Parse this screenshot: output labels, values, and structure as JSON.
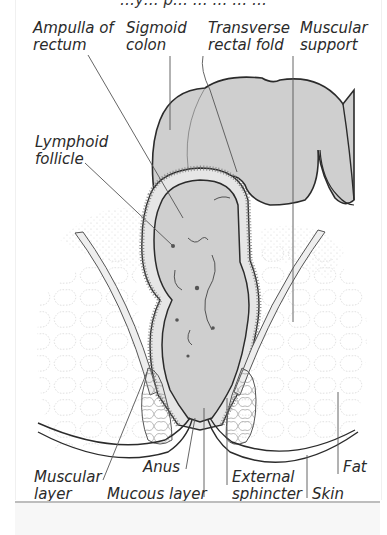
{
  "figure": {
    "title_partial": "…y… p… … … … …",
    "colors": {
      "tissue_fill": "#cfcfcf",
      "outline": "#2b2b2b",
      "leader_line": "#555555",
      "text": "#2a2a2a",
      "background": "#ffffff"
    },
    "labels": {
      "ampulla": "Ampulla of\nrectum",
      "sigmoid": "Sigmoid\ncolon",
      "transverse": "Transverse\nrectal fold",
      "muscular_support": "Muscular\nsupport",
      "lymphoid": "Lymphoid\nfollicle",
      "muscular_layer": "Muscular\nlayer",
      "anus": "Anus",
      "mucous_layer": "Mucous layer",
      "external_sphincter": "External\nsphincter",
      "skin": "Skin",
      "fat": "Fat"
    }
  }
}
